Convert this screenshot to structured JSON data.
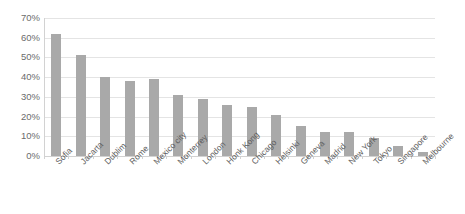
{
  "chart_data": {
    "type": "bar",
    "title": "",
    "xlabel": "",
    "ylabel": "",
    "ylim": [
      0,
      70
    ],
    "ytick_labels": [
      "70%",
      "60%",
      "50%",
      "40%",
      "30%",
      "20%",
      "10%",
      "0%"
    ],
    "ytick_values": [
      70,
      60,
      50,
      40,
      30,
      20,
      10,
      0
    ],
    "grid": true,
    "legend": "none",
    "bar_color": "#a9a9a9",
    "gridline_color": "#e4e4e4",
    "axis_color": "#d2d2d2",
    "categories": [
      "Sofia",
      "Jacarta",
      "Dublim",
      "Rome",
      "Mexico city",
      "Monterrey",
      "London",
      "Honk Kong",
      "Chicago",
      "Helsinki",
      "Geneva",
      "Madrid",
      "New York",
      "Tokyo",
      "Singapore",
      "Melbourne"
    ],
    "values": [
      62,
      51,
      40,
      38,
      39,
      31,
      29,
      26,
      25,
      21,
      15,
      12,
      12,
      9,
      5,
      2
    ]
  }
}
